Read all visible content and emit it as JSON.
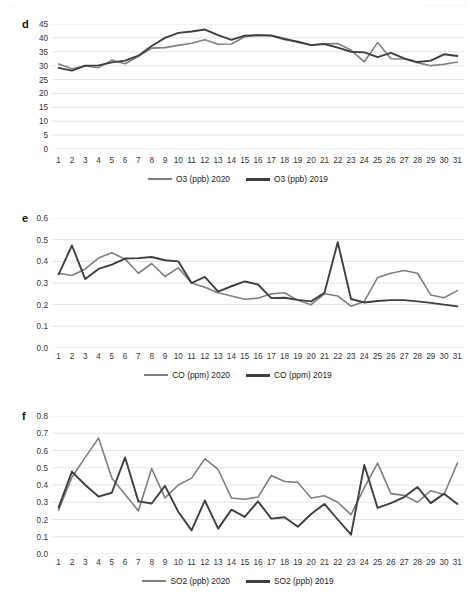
{
  "header": {
    "left": "xxx",
    "right": "xxxx xxxxxx xxx"
  },
  "colors": {
    "series_2020": "#7f7f7f",
    "series_2019": "#3f3f3f",
    "gridline": "#e3e3e3",
    "text": "#333333"
  },
  "panels": [
    {
      "letter": "d",
      "legend": [
        {
          "label": "O3 (ppb) 2020",
          "color": "#7f7f7f"
        },
        {
          "label": "O3 (ppb) 2019",
          "color": "#3f3f3f"
        }
      ],
      "chart_data": {
        "type": "line",
        "title": "",
        "xlabel": "",
        "ylabel": "",
        "grid": true,
        "legend_position": "bottom",
        "ylim": [
          0,
          45
        ],
        "yticks": [
          0,
          5,
          10,
          15,
          20,
          25,
          30,
          35,
          40,
          45
        ],
        "ytick_labels": [
          "0",
          "5",
          "10",
          "15",
          "20",
          "25",
          "30",
          "35",
          "40",
          "45"
        ],
        "x": [
          1,
          2,
          3,
          4,
          5,
          6,
          7,
          8,
          9,
          10,
          11,
          12,
          13,
          14,
          15,
          16,
          17,
          18,
          19,
          20,
          21,
          22,
          23,
          24,
          25,
          26,
          27,
          28,
          29,
          30,
          31
        ],
        "xtick_labels": [
          "1",
          "2",
          "3",
          "4",
          "5",
          "6",
          "7",
          "8",
          "9",
          "10",
          "11",
          "12",
          "13",
          "14",
          "15",
          "16",
          "17",
          "18",
          "19",
          "20",
          "21",
          "22",
          "23",
          "24",
          "25",
          "26",
          "27",
          "28",
          "29",
          "30",
          "31"
        ],
        "series": [
          {
            "name": "O3 (ppb) 2020",
            "color": "#7f7f7f",
            "values": [
              30.6,
              28.9,
              29.9,
              29.3,
              32.0,
              30.7,
              33.4,
              36.3,
              36.5,
              37.3,
              38.1,
              39.3,
              37.7,
              37.8,
              40.4,
              41.0,
              40.9,
              39.8,
              38.4,
              37.4,
              37.9,
              38.0,
              35.6,
              31.4,
              38.3,
              32.5,
              32.4,
              31.1,
              30.0,
              30.5,
              31.3
            ]
          },
          {
            "name": "O3 (ppb) 2019",
            "color": "#3f3f3f",
            "values": [
              29.2,
              28.2,
              30.0,
              30.1,
              31.2,
              31.8,
              33.6,
              37.1,
              40.0,
              41.8,
              42.3,
              43.0,
              41.0,
              39.3,
              40.8,
              41.0,
              40.8,
              39.5,
              38.6,
              37.4,
              37.8,
              36.5,
              35.0,
              34.8,
              33.1,
              34.6,
              32.6,
              31.3,
              31.8,
              34.1,
              33.5
            ]
          }
        ]
      }
    },
    {
      "letter": "e",
      "legend": [
        {
          "label": "CO (ppm) 2020",
          "color": "#7f7f7f"
        },
        {
          "label": "CO (ppm) 2019",
          "color": "#3f3f3f"
        }
      ],
      "chart_data": {
        "type": "line",
        "title": "",
        "xlabel": "",
        "ylabel": "",
        "grid": true,
        "legend_position": "bottom",
        "ylim": [
          0.0,
          0.6
        ],
        "yticks": [
          0.0,
          0.1,
          0.2,
          0.3,
          0.4,
          0.5,
          0.6
        ],
        "ytick_labels": [
          "0.0",
          "0.1",
          "0.2",
          "0.3",
          "0.4",
          "0.5",
          "0.6"
        ],
        "x": [
          1,
          2,
          3,
          4,
          5,
          6,
          7,
          8,
          9,
          10,
          11,
          12,
          13,
          14,
          15,
          16,
          17,
          18,
          19,
          20,
          21,
          22,
          23,
          24,
          25,
          26,
          27,
          28,
          29,
          30,
          31
        ],
        "xtick_labels": [
          "1",
          "2",
          "3",
          "4",
          "5",
          "6",
          "7",
          "8",
          "9",
          "10",
          "11",
          "12",
          "13",
          "14",
          "15",
          "16",
          "17",
          "18",
          "19",
          "20",
          "21",
          "22",
          "23",
          "24",
          "25",
          "26",
          "27",
          "28",
          "29",
          "30",
          "31"
        ],
        "series": [
          {
            "name": "CO (ppm) 2020",
            "color": "#7f7f7f",
            "values": [
              0.345,
              0.335,
              0.365,
              0.415,
              0.44,
              0.41,
              0.345,
              0.39,
              0.33,
              0.37,
              0.3,
              0.28,
              0.255,
              0.24,
              0.225,
              0.23,
              0.25,
              0.255,
              0.22,
              0.2,
              0.25,
              0.24,
              0.193,
              0.215,
              0.325,
              0.345,
              0.358,
              0.345,
              0.245,
              0.232,
              0.265
            ]
          },
          {
            "name": "CO (ppm) 2019",
            "color": "#3f3f3f",
            "values": [
              0.34,
              0.473,
              0.318,
              0.365,
              0.385,
              0.413,
              0.415,
              0.42,
              0.405,
              0.4,
              0.3,
              0.328,
              0.26,
              0.285,
              0.307,
              0.293,
              0.23,
              0.232,
              0.222,
              0.215,
              0.255,
              0.488,
              0.226,
              0.21,
              0.217,
              0.221,
              0.221,
              0.215,
              0.208,
              0.2,
              0.192
            ]
          }
        ]
      }
    },
    {
      "letter": "f",
      "legend": [
        {
          "label": "SO2 (ppb) 2020",
          "color": "#7f7f7f"
        },
        {
          "label": "SO2 (ppb) 2019",
          "color": "#3f3f3f"
        }
      ],
      "chart_data": {
        "type": "line",
        "title": "",
        "xlabel": "",
        "ylabel": "",
        "grid": true,
        "legend_position": "bottom",
        "ylim": [
          0.0,
          0.8
        ],
        "yticks": [
          0.0,
          0.1,
          0.2,
          0.3,
          0.4,
          0.5,
          0.6,
          0.7,
          0.8
        ],
        "ytick_labels": [
          "0.0",
          "0.1",
          "0.2",
          "0.3",
          "0.4",
          "0.5",
          "0.6",
          "0.7",
          "0.8"
        ],
        "x": [
          1,
          2,
          3,
          4,
          5,
          6,
          7,
          8,
          9,
          10,
          11,
          12,
          13,
          14,
          15,
          16,
          17,
          18,
          19,
          20,
          21,
          22,
          23,
          24,
          25,
          26,
          27,
          28,
          29,
          30,
          31
        ],
        "xtick_labels": [
          "1",
          "2",
          "3",
          "4",
          "5",
          "6",
          "7",
          "8",
          "9",
          "10",
          "11",
          "12",
          "13",
          "14",
          "15",
          "16",
          "17",
          "18",
          "19",
          "20",
          "21",
          "22",
          "23",
          "24",
          "25",
          "26",
          "27",
          "28",
          "29",
          "30",
          "31"
        ],
        "series": [
          {
            "name": "SO2 (ppb) 2020",
            "color": "#7f7f7f",
            "values": [
              0.255,
              0.445,
              0.56,
              0.672,
              0.44,
              0.345,
              0.25,
              0.495,
              0.325,
              0.4,
              0.44,
              0.553,
              0.49,
              0.325,
              0.317,
              0.33,
              0.455,
              0.42,
              0.415,
              0.325,
              0.338,
              0.3,
              0.228,
              0.385,
              0.527,
              0.35,
              0.34,
              0.3,
              0.367,
              0.345,
              0.527
            ]
          },
          {
            "name": "SO2 (ppb) 2019",
            "color": "#3f3f3f",
            "values": [
              0.27,
              0.478,
              0.4,
              0.333,
              0.355,
              0.56,
              0.305,
              0.293,
              0.395,
              0.245,
              0.137,
              0.31,
              0.147,
              0.257,
              0.215,
              0.305,
              0.205,
              0.213,
              0.158,
              0.232,
              0.29,
              0.2,
              0.112,
              0.516,
              0.267,
              0.295,
              0.33,
              0.388,
              0.295,
              0.35,
              0.29
            ]
          }
        ]
      }
    }
  ]
}
